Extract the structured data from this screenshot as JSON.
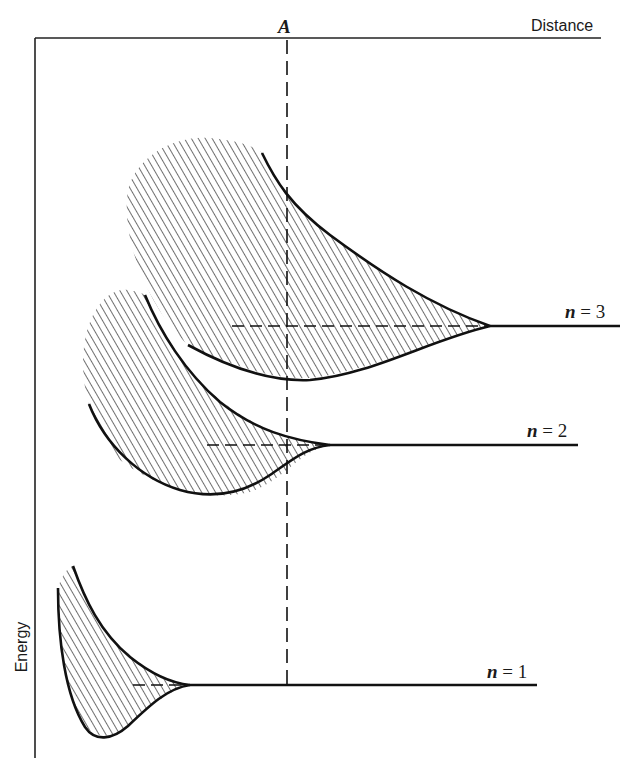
{
  "diagram": {
    "title": "",
    "axes": {
      "x_label": "Distance",
      "y_label": "Energy"
    },
    "marker": {
      "label": "A",
      "style": "dashed vertical line"
    },
    "levels": [
      {
        "id": "n3",
        "variable": "n",
        "equals": " = ",
        "value": "3",
        "y_px": 326
      },
      {
        "id": "n2",
        "variable": "n",
        "equals": " = ",
        "value": "2",
        "y_px": 445
      },
      {
        "id": "n1",
        "variable": "n",
        "equals": " = ",
        "value": "1",
        "y_px": 685
      }
    ],
    "colors": {
      "line": "#111111",
      "hatch": "#222222",
      "background": "#ffffff"
    }
  }
}
